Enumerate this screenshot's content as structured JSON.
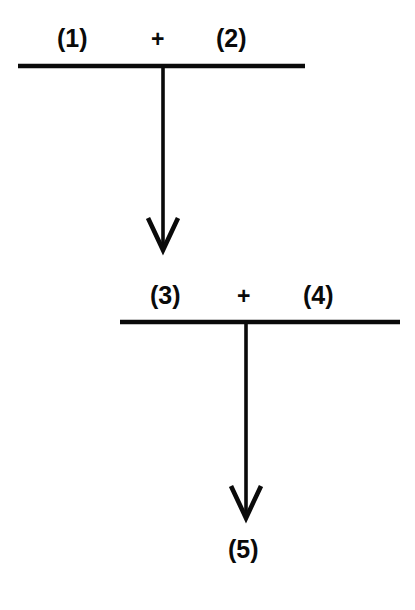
{
  "diagram": {
    "background_color": "#ffffff",
    "stroke_color": "#0a0a0a",
    "step1": {
      "reactant_left": "(1)",
      "operator": "+",
      "reactant_right": "(2)",
      "rule_line": {
        "x1": 18,
        "x2": 305,
        "y": 66,
        "thickness": 4
      },
      "arrow": {
        "x": 163,
        "y_start": 66,
        "y_end": 250,
        "head": "chevron-down"
      }
    },
    "step2": {
      "reactant_left": "(3)",
      "operator": "+",
      "reactant_right": "(4)",
      "rule_line": {
        "x1": 120,
        "x2": 400,
        "y": 322,
        "thickness": 4
      },
      "arrow": {
        "x": 246,
        "y_start": 322,
        "y_end": 518,
        "head": "chevron-down"
      }
    },
    "product": {
      "label": "(5)"
    }
  }
}
